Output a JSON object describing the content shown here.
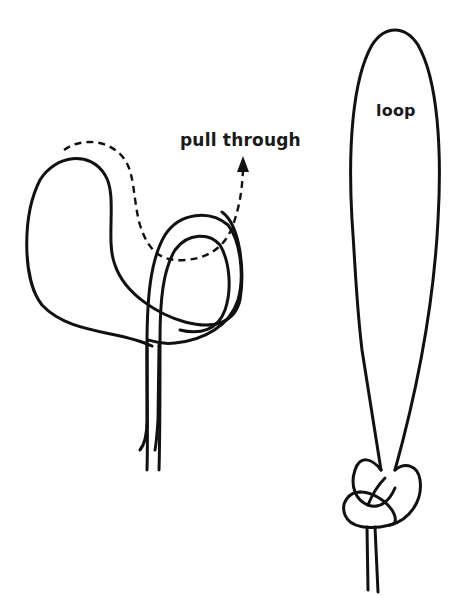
{
  "diagram": {
    "colors": {
      "line": "#111111",
      "background": "#ffffff"
    },
    "left_figure": {
      "step": "forming the knot",
      "label": "pull through",
      "arrow_icon": "dashed-arrow-up"
    },
    "right_figure": {
      "step": "finished loop knot",
      "label": "loop"
    }
  }
}
